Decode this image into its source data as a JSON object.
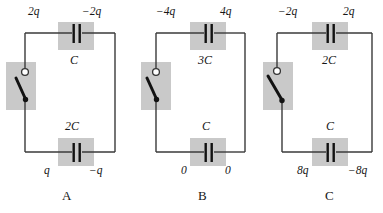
{
  "figure": {
    "type": "physics-circuit-diagram",
    "background_color": "#ffffff",
    "wire_color": "#3a3a3a",
    "plate_color": "#121212",
    "highlight_box_color": "#c9c9c9",
    "text_color": "#161616"
  },
  "panels": [
    {
      "id": "A",
      "letter": "A",
      "top_capacitor": {
        "name": "C",
        "left_charge": "2q",
        "right_charge": "−2q",
        "name_position": "below"
      },
      "bottom_capacitor": {
        "name": "2C",
        "left_charge": "q",
        "right_charge": "−q",
        "name_position": "above"
      },
      "switch": {
        "state": "open",
        "terminal_top": "open-circle",
        "terminal_bottom": "filled-dot"
      }
    },
    {
      "id": "B",
      "letter": "B",
      "top_capacitor": {
        "name": "3C",
        "left_charge": "−4q",
        "right_charge": "4q",
        "name_position": "below"
      },
      "bottom_capacitor": {
        "name": "C",
        "left_charge": "0",
        "right_charge": "0",
        "name_position": "above"
      },
      "switch": {
        "state": "open",
        "terminal_top": "open-circle",
        "terminal_bottom": "filled-dot"
      }
    },
    {
      "id": "C",
      "letter": "C",
      "top_capacitor": {
        "name": "2C",
        "left_charge": "−2q",
        "right_charge": "2q",
        "name_position": "below"
      },
      "bottom_capacitor": {
        "name": "C",
        "left_charge": "8q",
        "right_charge": "−8q",
        "name_position": "above"
      },
      "switch": {
        "state": "open",
        "terminal_top": "open-circle",
        "terminal_bottom": "filled-dot"
      }
    }
  ]
}
